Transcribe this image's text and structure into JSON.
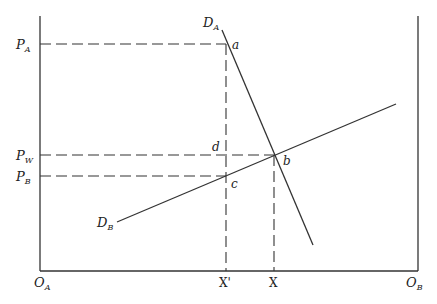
{
  "diagram": {
    "type": "two-country trade / specific factor box diagram",
    "axes": {
      "origin_left": {
        "label": "O",
        "sub": "A"
      },
      "origin_right": {
        "label": "O",
        "sub": "B"
      }
    },
    "price_labels": [
      {
        "id": "PA",
        "label": "P",
        "sub": "A",
        "y": 44
      },
      {
        "id": "PW",
        "label": "P",
        "sub": "W",
        "y": 155
      },
      {
        "id": "PB",
        "label": "P",
        "sub": "B",
        "y": 176
      }
    ],
    "quantity_labels": [
      {
        "id": "Xprime",
        "label": "X'",
        "x": 226
      },
      {
        "id": "X",
        "label": "X",
        "x": 274
      }
    ],
    "curves": [
      {
        "id": "DA",
        "label": "D",
        "sub": "A",
        "from": [
          222,
          30
        ],
        "to": [
          313,
          245
        ]
      },
      {
        "id": "DB",
        "label": "D",
        "sub": "B",
        "from": [
          117,
          222
        ],
        "to": [
          396,
          104
        ]
      }
    ],
    "points": [
      {
        "id": "a",
        "label": "a",
        "x": 226,
        "y": 44
      },
      {
        "id": "b",
        "label": "b",
        "x": 274,
        "y": 155
      },
      {
        "id": "c",
        "label": "c",
        "x": 226,
        "y": 176
      },
      {
        "id": "d",
        "label": "d",
        "x": 226,
        "y": 155
      }
    ]
  }
}
